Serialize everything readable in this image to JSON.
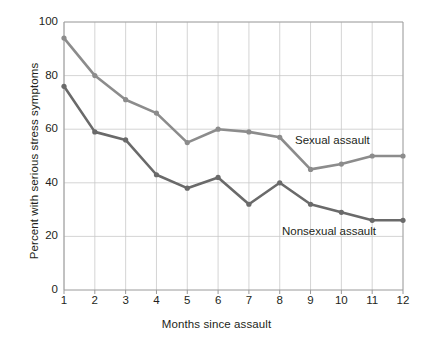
{
  "chart_data": {
    "type": "line",
    "title": "",
    "xlabel": "Months since assault",
    "ylabel": "Percent with serious stress symptoms",
    "x": [
      1,
      2,
      3,
      4,
      5,
      6,
      7,
      8,
      9,
      10,
      11,
      12
    ],
    "categories": [
      "1",
      "2",
      "3",
      "4",
      "5",
      "6",
      "7",
      "8",
      "9",
      "10",
      "11",
      "12"
    ],
    "xlim": [
      1,
      12
    ],
    "ylim": [
      0,
      100
    ],
    "yticks": [
      0,
      20,
      40,
      60,
      80,
      100
    ],
    "ytick_labels": [
      "0",
      "20",
      "40",
      "60",
      "80",
      "100"
    ],
    "grid": true,
    "legend_position": "inline-annotations",
    "series": [
      {
        "name": "Sexual assault",
        "color": "#8c8c8c",
        "values": [
          94,
          80,
          71,
          66,
          55,
          60,
          59,
          57,
          45,
          47,
          50,
          50
        ]
      },
      {
        "name": "Nonsexual assault",
        "color": "#6a6a6a",
        "values": [
          76,
          59,
          56,
          43,
          38,
          42,
          32,
          40,
          32,
          29,
          26,
          26
        ]
      }
    ],
    "annotations": [
      {
        "text": "Sexual assault",
        "near_x": 9,
        "near_y": 56
      },
      {
        "text": "Nonsexual assault",
        "near_x": 9,
        "near_y": 22
      }
    ]
  },
  "style": {
    "grid_color": "#c9c9c9",
    "axis_color": "#9a9a9a",
    "text_color": "#231f20",
    "background": "#ffffff"
  }
}
